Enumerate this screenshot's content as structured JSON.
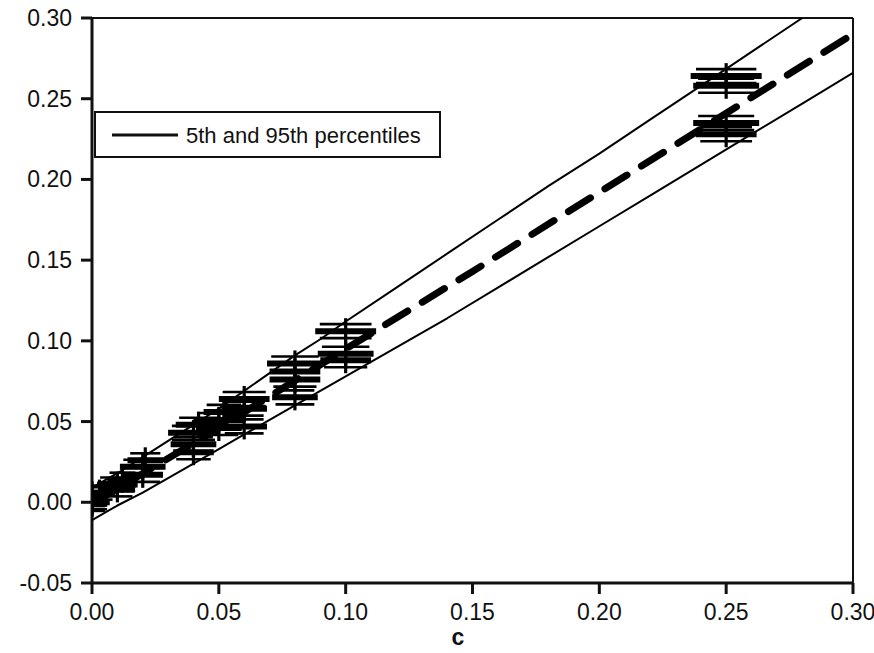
{
  "chart_data": {
    "type": "scatter",
    "title": "",
    "xlabel": "c",
    "ylabel": "",
    "xlim": [
      0.0,
      0.3
    ],
    "ylim": [
      -0.05,
      0.3
    ],
    "xticks": [
      0.0,
      0.05,
      0.1,
      0.15,
      0.2,
      0.25,
      0.3
    ],
    "xtick_labels": [
      "0.00",
      "0.05",
      "0.10",
      "0.15",
      "0.20",
      "0.25",
      "0.30"
    ],
    "yticks": [
      -0.05,
      0.0,
      0.05,
      0.1,
      0.15,
      0.2,
      0.25,
      0.3
    ],
    "ytick_labels": [
      "-0.05",
      "0.00",
      "0.05",
      "0.10",
      "0.15",
      "0.20",
      "0.25",
      "0.30"
    ],
    "grid": false,
    "legend_position": "upper-left",
    "legend": [
      {
        "label": "5th and 95th percentiles",
        "style": "solid-thin",
        "color": "#000000"
      }
    ],
    "series": [
      {
        "name": "5th and 95th percentiles",
        "type": "line",
        "style": "solid",
        "width": 2,
        "color": "#000000",
        "comment": "upper 95th percentile band",
        "x": [
          0.0,
          0.01,
          0.02,
          0.03,
          0.04,
          0.05,
          0.06,
          0.07,
          0.08,
          0.09,
          0.1,
          0.12,
          0.14,
          0.16,
          0.18,
          0.2,
          0.22,
          0.24,
          0.26,
          0.28
        ],
        "y": [
          0.009,
          0.018,
          0.028,
          0.038,
          0.048,
          0.058,
          0.069,
          0.08,
          0.091,
          0.101,
          0.112,
          0.133,
          0.154,
          0.175,
          0.196,
          0.216,
          0.237,
          0.258,
          0.279,
          0.3
        ]
      },
      {
        "name": "5th and 95th percentiles",
        "type": "line",
        "style": "solid",
        "width": 2,
        "color": "#000000",
        "comment": "lower 5th percentile band",
        "x": [
          0.0,
          0.01,
          0.02,
          0.03,
          0.04,
          0.05,
          0.06,
          0.07,
          0.08,
          0.09,
          0.1,
          0.12,
          0.14,
          0.16,
          0.18,
          0.2,
          0.22,
          0.24,
          0.26,
          0.28,
          0.3
        ],
        "y": [
          -0.011,
          -0.002,
          0.006,
          0.015,
          0.024,
          0.033,
          0.042,
          0.051,
          0.06,
          0.069,
          0.078,
          0.096,
          0.114,
          0.133,
          0.152,
          0.171,
          0.19,
          0.209,
          0.228,
          0.247,
          0.266
        ]
      },
      {
        "name": "mean line",
        "type": "line",
        "style": "dashed",
        "width": 7,
        "color": "#000000",
        "comment": "central heavy dashed reference line",
        "x": [
          0.0,
          0.05,
          0.1,
          0.15,
          0.2,
          0.25,
          0.3
        ],
        "y": [
          -0.001,
          0.046,
          0.095,
          0.143,
          0.192,
          0.241,
          0.29
        ]
      },
      {
        "name": "observations",
        "type": "scatter",
        "marker": "plus-with-horizontal-error-bars",
        "color": "#000000",
        "points": [
          {
            "x": 0.0,
            "y": 0.002,
            "xerr": 0.006
          },
          {
            "x": 0.0,
            "y": -0.001,
            "xerr": 0.006
          },
          {
            "x": 0.0,
            "y": 0.005,
            "xerr": 0.005
          },
          {
            "x": 0.0,
            "y": 0.0,
            "xerr": 0.007
          },
          {
            "x": 0.003,
            "y": 0.006,
            "xerr": 0.006
          },
          {
            "x": 0.01,
            "y": 0.011,
            "xerr": 0.008
          },
          {
            "x": 0.01,
            "y": 0.008,
            "xerr": 0.007
          },
          {
            "x": 0.012,
            "y": 0.014,
            "xerr": 0.006
          },
          {
            "x": 0.02,
            "y": 0.022,
            "xerr": 0.009
          },
          {
            "x": 0.02,
            "y": 0.017,
            "xerr": 0.008
          },
          {
            "x": 0.021,
            "y": 0.026,
            "xerr": 0.007
          },
          {
            "x": 0.04,
            "y": 0.043,
            "xerr": 0.01
          },
          {
            "x": 0.04,
            "y": 0.036,
            "xerr": 0.009
          },
          {
            "x": 0.04,
            "y": 0.031,
            "xerr": 0.008
          },
          {
            "x": 0.042,
            "y": 0.048,
            "xerr": 0.009
          },
          {
            "x": 0.05,
            "y": 0.051,
            "xerr": 0.01
          },
          {
            "x": 0.05,
            "y": 0.046,
            "xerr": 0.009
          },
          {
            "x": 0.052,
            "y": 0.056,
            "xerr": 0.008
          },
          {
            "x": 0.06,
            "y": 0.064,
            "xerr": 0.01
          },
          {
            "x": 0.06,
            "y": 0.058,
            "xerr": 0.009
          },
          {
            "x": 0.06,
            "y": 0.047,
            "xerr": 0.009
          },
          {
            "x": 0.08,
            "y": 0.086,
            "xerr": 0.011
          },
          {
            "x": 0.08,
            "y": 0.081,
            "xerr": 0.01
          },
          {
            "x": 0.08,
            "y": 0.076,
            "xerr": 0.01
          },
          {
            "x": 0.08,
            "y": 0.065,
            "xerr": 0.009
          },
          {
            "x": 0.1,
            "y": 0.106,
            "xerr": 0.012
          },
          {
            "x": 0.1,
            "y": 0.092,
            "xerr": 0.011
          },
          {
            "x": 0.1,
            "y": 0.088,
            "xerr": 0.01
          },
          {
            "x": 0.25,
            "y": 0.264,
            "xerr": 0.014
          },
          {
            "x": 0.25,
            "y": 0.258,
            "xerr": 0.013
          },
          {
            "x": 0.25,
            "y": 0.235,
            "xerr": 0.013
          },
          {
            "x": 0.25,
            "y": 0.228,
            "xerr": 0.012
          }
        ]
      }
    ]
  },
  "axes": {
    "x_title": "c",
    "y_title": ""
  },
  "legend_box": {
    "entry_label": "5th and 95th percentiles"
  }
}
